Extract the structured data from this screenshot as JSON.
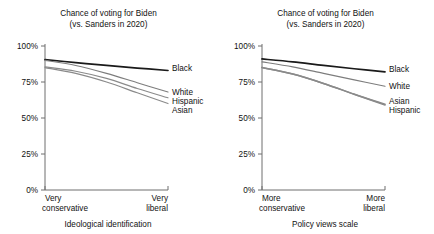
{
  "figure": {
    "panels": [
      {
        "id": "ideology",
        "title_line1": "Chance of voting for Biden",
        "title_line2": "(vs. Sanders in 2020)",
        "y_ticks": [
          "100%",
          "75%",
          "50%",
          "25%",
          "0%"
        ],
        "x_left_line1": "Very",
        "x_left_line2": "conservative",
        "x_right_line1": "Very",
        "x_right_line2": "liberal",
        "x_axis_name": "Ideological identification",
        "series_labels": [
          "Black",
          "White",
          "Hispanic",
          "Asian"
        ]
      },
      {
        "id": "policy",
        "title_line1": "Chance of voting for Biden",
        "title_line2": "(vs. Sanders in 2020)",
        "y_ticks": [
          "100%",
          "75%",
          "50%",
          "25%",
          "0%"
        ],
        "x_left_line1": "More",
        "x_left_line2": "conservative",
        "x_right_line1": "More",
        "x_right_line2": "liberal",
        "x_axis_name": "Policy views scale",
        "series_labels": [
          "Black",
          "White",
          "Asian",
          "Hispanic"
        ]
      }
    ]
  },
  "colors": {
    "black_series": "#1a1a1a",
    "white_series": "#7d7d7d",
    "hispanic_series": "#8a8a8a",
    "asian_series": "#8a8a8a",
    "axis": "#6e6e6e",
    "text": "#111111",
    "background": "#ffffff"
  },
  "chart_data": [
    {
      "type": "line",
      "id": "ideology",
      "title": "Chance of voting for Biden (vs. Sanders in 2020)",
      "xlabel": "Ideological identification",
      "ylabel": "",
      "ylim": [
        0,
        100
      ],
      "yticks": [
        0,
        25,
        50,
        75,
        100
      ],
      "ytick_labels": [
        "0%",
        "25%",
        "50%",
        "75%",
        "100%"
      ],
      "xlim": [
        0,
        1
      ],
      "xtick_labels": [
        "Very conservative",
        "Very liberal"
      ],
      "grid": false,
      "legend": "right-inline-labels",
      "x": [
        0,
        0.25,
        0.5,
        0.75,
        1
      ],
      "series": [
        {
          "name": "Black",
          "values": [
            90.5,
            88.5,
            86.5,
            84.7,
            83.0
          ],
          "color": "#1a1a1a",
          "width": 1.7
        },
        {
          "name": "White",
          "values": [
            90.0,
            86.5,
            81.0,
            74.5,
            68.0
          ],
          "color": "#7d7d7d",
          "width": 1.1
        },
        {
          "name": "Hispanic",
          "values": [
            85.5,
            82.5,
            77.5,
            70.5,
            64.0
          ],
          "color": "#8a8a8a",
          "width": 1.1
        },
        {
          "name": "Asian",
          "values": [
            85.0,
            81.0,
            75.0,
            67.5,
            60.0
          ],
          "color": "#8a8a8a",
          "width": 1.1
        }
      ]
    },
    {
      "type": "line",
      "id": "policy",
      "title": "Chance of voting for Biden (vs. Sanders in 2020)",
      "xlabel": "Policy views scale",
      "ylabel": "",
      "ylim": [
        0,
        100
      ],
      "yticks": [
        0,
        25,
        50,
        75,
        100
      ],
      "ytick_labels": [
        "0%",
        "25%",
        "50%",
        "75%",
        "100%"
      ],
      "xlim": [
        0,
        1
      ],
      "xtick_labels": [
        "More conservative",
        "More liberal"
      ],
      "grid": false,
      "legend": "right-inline-labels",
      "x": [
        0,
        0.25,
        0.5,
        0.75,
        1
      ],
      "series": [
        {
          "name": "Black",
          "values": [
            91.0,
            89.0,
            86.5,
            84.2,
            82.0
          ],
          "color": "#1a1a1a",
          "width": 1.7
        },
        {
          "name": "White",
          "values": [
            89.0,
            85.5,
            81.0,
            76.5,
            72.0
          ],
          "color": "#7d7d7d",
          "width": 1.1
        },
        {
          "name": "Asian",
          "values": [
            85.0,
            80.5,
            74.0,
            66.5,
            59.5
          ],
          "color": "#8a8a8a",
          "width": 1.5
        },
        {
          "name": "Hispanic",
          "values": [
            85.0,
            80.5,
            74.0,
            66.5,
            59.0
          ],
          "color": "#8a8a8a",
          "width": 1.5
        }
      ]
    }
  ]
}
